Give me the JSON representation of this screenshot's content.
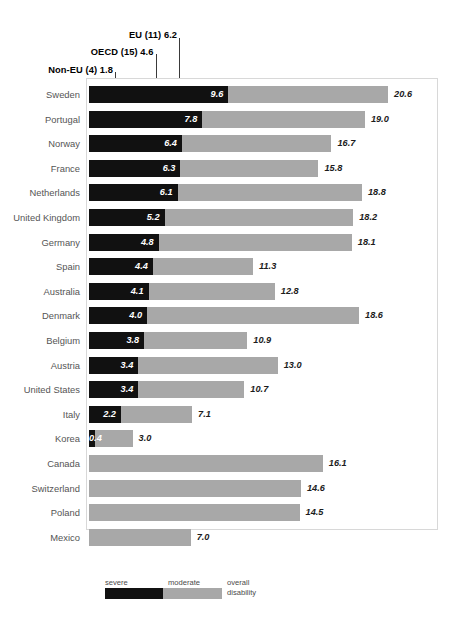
{
  "chart_data": {
    "type": "bar",
    "orientation": "horizontal",
    "stacked": true,
    "title": "",
    "subtitle": "",
    "xlabel": "",
    "ylabel": "",
    "xlim": [
      0,
      20.6
    ],
    "grid": false,
    "legend_position": "bottom",
    "categories": [
      "Sweden",
      "Portugal",
      "Norway",
      "France",
      "Netherlands",
      "United Kingdom",
      "Germany",
      "Spain",
      "Australia",
      "Denmark",
      "Belgium",
      "Austria",
      "United States",
      "Italy",
      "Korea",
      "Canada",
      "Switzerland",
      "Poland",
      "Mexico"
    ],
    "series": [
      {
        "name": "severe",
        "values": [
          9.6,
          7.8,
          6.4,
          6.3,
          6.1,
          5.2,
          4.8,
          4.4,
          4.1,
          4.0,
          3.8,
          3.4,
          3.4,
          2.2,
          0.4,
          null,
          null,
          null,
          null
        ]
      },
      {
        "name": "overall disability",
        "values": [
          20.6,
          19.0,
          16.7,
          15.8,
          18.8,
          18.2,
          18.1,
          11.3,
          12.8,
          18.6,
          10.9,
          13.0,
          10.7,
          7.1,
          3.0,
          16.1,
          14.6,
          14.5,
          7.0
        ]
      }
    ],
    "annotations": [
      {
        "label": "Non-EU (4)",
        "value": "1.8",
        "x": 1.8
      },
      {
        "label": "OECD (15)",
        "value": "4.6",
        "x": 4.6
      },
      {
        "label": "EU (11)",
        "value": "6.2",
        "x": 6.2
      }
    ],
    "legend": {
      "severe_label": "severe",
      "moderate_label": "moderate",
      "overall_label_line1": "overall",
      "overall_label_line2": "disability"
    },
    "colors": {
      "severe": "#111111",
      "moderate": "#a8a8a8",
      "frame": "#d8d8d8",
      "ref_line": "#3a3a3a",
      "category_text": "#555555",
      "value_text": "#1c1c1c"
    }
  }
}
